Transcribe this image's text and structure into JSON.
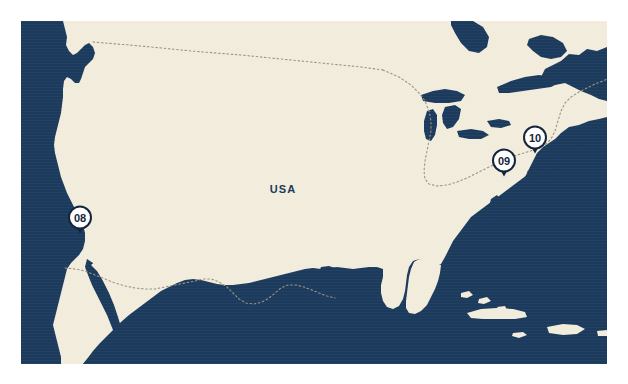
{
  "map": {
    "title": "USA",
    "country_label": "USA",
    "colors": {
      "water": "#1b3a5c",
      "land": "#f2ecdc",
      "border_line": "#9a937f",
      "marker_stroke": "#16263a",
      "marker_fill": "#ffffff",
      "label_text": "#1b3a5c",
      "page_background": "#ffffff"
    },
    "frame": {
      "x": 21,
      "y": 21,
      "width": 586,
      "height": 343
    },
    "country_label_position": {
      "x": 262,
      "y": 168
    },
    "markers": [
      {
        "id": "marker-08",
        "label": "08",
        "x": 59,
        "y": 200,
        "region": "west-coast"
      },
      {
        "id": "marker-09",
        "label": "09",
        "x": 483,
        "y": 143,
        "region": "mid-atlantic"
      },
      {
        "id": "marker-10",
        "label": "10",
        "x": 514,
        "y": 120,
        "region": "northeast"
      }
    ]
  }
}
